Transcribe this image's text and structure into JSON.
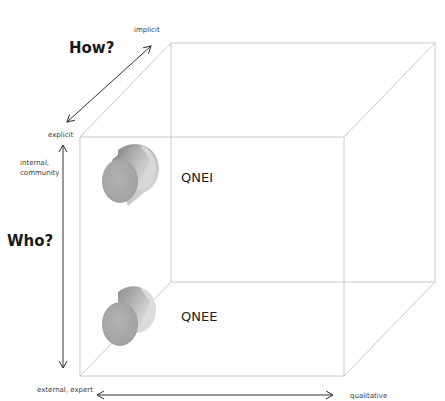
{
  "diagram": {
    "type": "3d-cube-classification",
    "axes": {
      "how": {
        "title": "How?",
        "start_label": "explicit",
        "end_label": "implicit"
      },
      "who": {
        "title": "Who?",
        "top_label": "internal,\ncommunity",
        "top_label_line1": "internal,",
        "top_label_line2": "community",
        "bottom_label": "external, expert"
      },
      "what": {
        "left_label": "",
        "right_label": "qualitative"
      }
    },
    "items": [
      {
        "label": "QNEI",
        "position": "front-top-left"
      },
      {
        "label": "QNEE",
        "position": "front-bottom-left"
      }
    ],
    "colors": {
      "cube_edges": "#b8b8b8",
      "arrows": "#333333",
      "cylinder_face": "#a9a9a9",
      "cylinder_body_light": "#d9d9d9",
      "cylinder_body_dark": "#8c8c8c"
    }
  }
}
